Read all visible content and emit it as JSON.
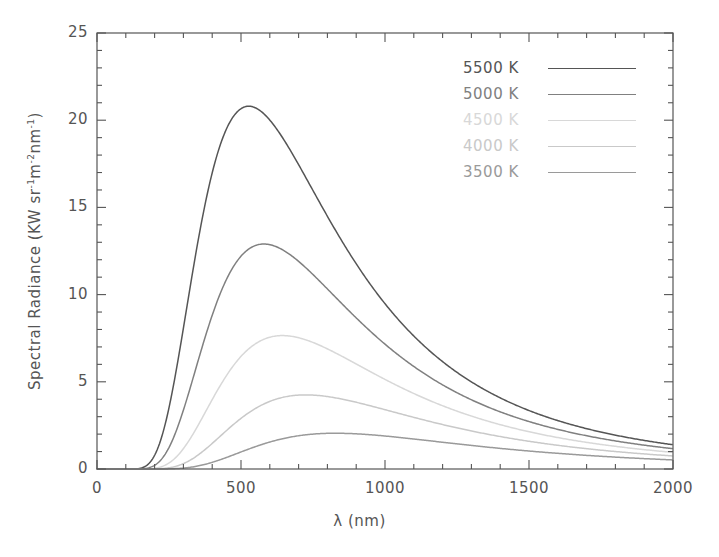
{
  "chart_data": {
    "type": "line",
    "title": "",
    "xlabel": "λ (nm)",
    "ylabel": "Spectral Radiance (KW sr−1m−2nm−1)",
    "ylabel_parts": {
      "main": "Spectral Radiance (KW sr",
      "e1": "-1",
      "m": "m",
      "e2": "-2",
      "nm": "nm",
      "e3": "-1",
      "close": ")"
    },
    "xlim": [
      0,
      2000
    ],
    "ylim": [
      0,
      25
    ],
    "xticks": [
      "0",
      "500",
      "1000",
      "1500",
      "2000"
    ],
    "xtick_values": [
      0,
      500,
      1000,
      1500,
      2000
    ],
    "yticks": [
      "0",
      "5",
      "10",
      "15",
      "20",
      "25"
    ],
    "ytick_values": [
      0,
      5,
      10,
      15,
      20,
      25
    ],
    "x_minor_step": 100,
    "y_minor_step": 1,
    "grid": false,
    "legend_position": "top-right",
    "axis_color": "#555555",
    "series": [
      {
        "name": "5500 K",
        "temperature_K": 5500,
        "color": "#555555",
        "peak_x": 527,
        "peak_y": 20.8,
        "value_at_2000nm": 1.35
      },
      {
        "name": "5000 K",
        "temperature_K": 5000,
        "color": "#808080",
        "peak_x": 580,
        "peak_y": 12.9,
        "value_at_2000nm": 1.05
      },
      {
        "name": "4500 K",
        "temperature_K": 4500,
        "color": "#d8d8d8",
        "peak_x": 644,
        "peak_y": 7.65,
        "value_at_2000nm": 0.78
      },
      {
        "name": "4000 K",
        "temperature_K": 4000,
        "color": "#c9c9c9",
        "peak_x": 725,
        "peak_y": 4.25,
        "value_at_2000nm": 0.55
      },
      {
        "name": "3500 K",
        "temperature_K": 3500,
        "color": "#9a9a9a",
        "peak_x": 828,
        "peak_y": 2.05,
        "value_at_2000nm": 0.36
      }
    ]
  },
  "legend": {
    "items": [
      {
        "label": "5500 K",
        "color": "#555555"
      },
      {
        "label": "5000 K",
        "color": "#808080"
      },
      {
        "label": "4500 K",
        "color": "#d8d8d8"
      },
      {
        "label": "4000 K",
        "color": "#c9c9c9"
      },
      {
        "label": "3500 K",
        "color": "#9a9a9a"
      }
    ]
  }
}
